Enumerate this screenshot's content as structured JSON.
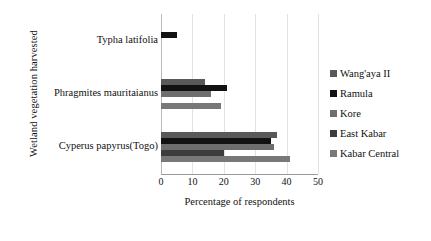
{
  "chart_data": {
    "type": "bar",
    "orientation": "horizontal",
    "title": "",
    "xlabel": "Percentage of respondents",
    "ylabel": "Wetland vegetation harvested",
    "categories": [
      "Typha latifolia",
      "Phragmites mauritaianus",
      "Cyperus papyrus(Togo)"
    ],
    "xlim": [
      0,
      50
    ],
    "xticks": [
      0,
      10,
      20,
      30,
      40,
      50
    ],
    "grid": true,
    "legend_position": "right",
    "series": [
      {
        "name": "Wang'aya II",
        "color": "#595959",
        "values": [
          0,
          14,
          37
        ]
      },
      {
        "name": "Ramula",
        "color": "#121212",
        "values": [
          5,
          21,
          35
        ]
      },
      {
        "name": "Kore",
        "color": "#6e6e6e",
        "values": [
          0,
          16,
          36
        ]
      },
      {
        "name": "East Kabar",
        "color": "#3d3d3d",
        "values": [
          0,
          0,
          20
        ]
      },
      {
        "name": "Kabar Central",
        "color": "#787878",
        "values": [
          0,
          19,
          41
        ]
      }
    ]
  },
  "colors": {
    "gridline": "#e3e3e3",
    "axis": "#9a9a9a",
    "text": "#111111",
    "background": "#ffffff"
  }
}
